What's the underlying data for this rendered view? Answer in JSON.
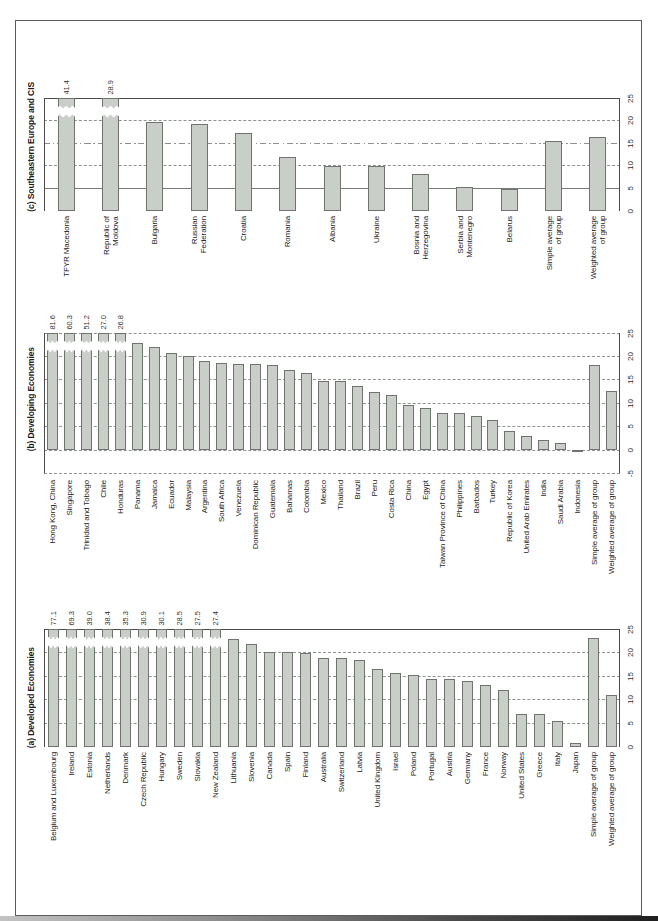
{
  "figure": {
    "page_bg": "#ffffff",
    "border_color": "#5b5b5b",
    "bar_fill": "#cacec9",
    "bar_border": "#70746f",
    "grid_color": "#8f938f",
    "axis_color": "#4a4a4a",
    "text_color": "#242424"
  },
  "chart_data": [
    {
      "type": "bar",
      "panel_label": "c",
      "title": "(c) Southeastern Europe and CIS",
      "xlabel": "",
      "ylabel": "",
      "ylim": [
        0,
        25
      ],
      "grid": "on",
      "legend": "none",
      "axis_position": "right",
      "yticks": [
        "25",
        "20",
        "15",
        "10",
        "5",
        "0"
      ],
      "gridlines": [
        {
          "v": 25,
          "style": "border"
        },
        {
          "v": 20,
          "style": "dashed"
        },
        {
          "v": 15,
          "style": "dashdot"
        },
        {
          "v": 10,
          "style": "dashed"
        },
        {
          "v": 5,
          "style": "solid"
        }
      ],
      "categories": [
        "TFYR Macedonia",
        "Republic of\nMoldova",
        "Bulgaria",
        "Russian\nFederation",
        "Croatia",
        "Romania",
        "Albania",
        "Ukraine",
        "Bosnia and\nHerzegovina",
        "Serbia and\nMontenegro",
        "Belarus",
        "Simple average\nof group",
        "Weighted average\nof group"
      ],
      "values": [
        41.4,
        28.9,
        19.7,
        19.2,
        17.2,
        11.9,
        10.0,
        10.0,
        8.1,
        5.4,
        4.9,
        15.6,
        16.3
      ],
      "break_labels": [
        "41.4",
        "28.9"
      ]
    },
    {
      "type": "bar",
      "panel_label": "b",
      "title": "(b) Developing Economies",
      "xlabel": "",
      "ylabel": "",
      "ylim": [
        -5,
        25
      ],
      "grid": "on",
      "legend": "none",
      "axis_position": "right",
      "yticks": [
        "25",
        "20",
        "15",
        "10",
        "5",
        "0",
        "-5"
      ],
      "gridlines": [
        {
          "v": 25,
          "style": "dashed"
        },
        {
          "v": 20,
          "style": "dashed"
        },
        {
          "v": 15,
          "style": "dashed"
        },
        {
          "v": 10,
          "style": "dashed"
        },
        {
          "v": 5,
          "style": "dashed"
        },
        {
          "v": 0,
          "style": "dashed"
        },
        {
          "v": -5,
          "style": "dashed"
        }
      ],
      "categories": [
        "Hong Kong, China",
        "Singapore",
        "Trinidad and Tobago",
        "Chile",
        "Honduras",
        "Panama",
        "Jamaica",
        "Ecuador",
        "Malaysia",
        "Argentina",
        "South Africa",
        "Venezuela",
        "Dominican Republic",
        "Guatemala",
        "Bahamas",
        "Colombia",
        "Mexico",
        "Thailand",
        "Brazil",
        "Peru",
        "Costa Rica",
        "China",
        "Egypt",
        "Taiwan Province of China",
        "Philippines",
        "Barbados",
        "Turkey",
        "Republic of Korea",
        "United Arab Emirates",
        "India",
        "Saudi Arabia",
        "Indonesia",
        "Simple average of group",
        "Weighted average of group"
      ],
      "values": [
        81.6,
        60.3,
        51.2,
        27.0,
        26.8,
        22.9,
        22.0,
        20.7,
        20.1,
        19.1,
        18.5,
        18.4,
        18.4,
        18.2,
        17.2,
        16.4,
        14.7,
        14.7,
        13.7,
        12.3,
        11.7,
        9.7,
        9.0,
        8.0,
        8.0,
        7.2,
        6.5,
        4.0,
        3.1,
        2.2,
        1.5,
        -0.5,
        18.2,
        12.7
      ],
      "break_labels": [
        "81.6",
        "60.3",
        "51.2",
        "27.0",
        "26.8"
      ]
    },
    {
      "type": "bar",
      "panel_label": "a",
      "title": "(a) Developed Economies",
      "xlabel": "",
      "ylabel": "",
      "ylim": [
        0,
        25
      ],
      "grid": "on",
      "legend": "none",
      "axis_position": "right",
      "yticks": [
        "25",
        "20",
        "15",
        "10",
        "5",
        "0"
      ],
      "gridlines": [
        {
          "v": 25,
          "style": "border"
        },
        {
          "v": 20,
          "style": "dashed"
        },
        {
          "v": 15,
          "style": "dashed"
        },
        {
          "v": 10,
          "style": "dashed"
        },
        {
          "v": 5,
          "style": "dashed"
        }
      ],
      "categories": [
        "Belgium and Luxembourg",
        "Ireland",
        "Estonia",
        "Netherlands",
        "Denmark",
        "Czech Republic",
        "Hungary",
        "Sweden",
        "Slovakia",
        "New Zealand",
        "Lithuania",
        "Slovenia",
        "Canada",
        "Spain",
        "Finland",
        "Australia",
        "Switzerland",
        "Latvia",
        "United Kingdom",
        "Israel",
        "Poland",
        "Portugal",
        "Austria",
        "Germany",
        "France",
        "Norway",
        "United States",
        "Greece",
        "Italy",
        "Japan",
        "Simple average of group",
        "Weighted average of group"
      ],
      "values": [
        77.1,
        69.3,
        39.0,
        38.4,
        35.3,
        30.9,
        30.1,
        28.5,
        27.5,
        27.4,
        22.9,
        21.8,
        20.1,
        20.1,
        20.0,
        18.9,
        18.9,
        18.5,
        16.5,
        15.7,
        15.2,
        14.5,
        14.5,
        13.9,
        13.1,
        12.1,
        7.1,
        6.9,
        5.5,
        0.8,
        23.1,
        11.0
      ],
      "break_labels": [
        "77.1",
        "69.3",
        "39.0",
        "38.4",
        "35.3",
        "30.9",
        "30.1",
        "28.5",
        "27.5",
        "27.4"
      ]
    }
  ]
}
